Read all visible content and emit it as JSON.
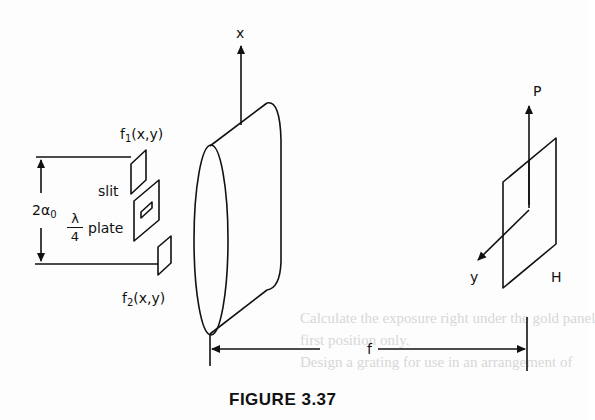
{
  "figure": {
    "caption": "FIGURE 3.37",
    "labels": {
      "x_axis": "x",
      "f1": "f",
      "f1_sub": "1",
      "f1_args": "(x,y)",
      "slit": "slit",
      "plate_num": "λ",
      "plate_den": "4",
      "plate_word": "plate",
      "two_alpha": "2α",
      "two_alpha_sub": "0",
      "f2": "f",
      "f2_sub": "2",
      "f2_args": "(x,y)",
      "p_axis": "P",
      "y_axis": "y",
      "h_plane": "H",
      "focal_length": "f"
    },
    "components": [
      "input-mask-f1",
      "slit-with-quarter-wave-plate",
      "input-mask-f2",
      "lens",
      "output-plane-PH"
    ],
    "colors": {
      "ink": "#111111",
      "paper": "#fdfdfd",
      "bleed_through": "#d7d7d7"
    }
  },
  "background_text": {
    "lines": [
      "Calculate the exposure right under the gold panel",
      "first position only.",
      "Design a grating for use in an arrangement of"
    ]
  }
}
